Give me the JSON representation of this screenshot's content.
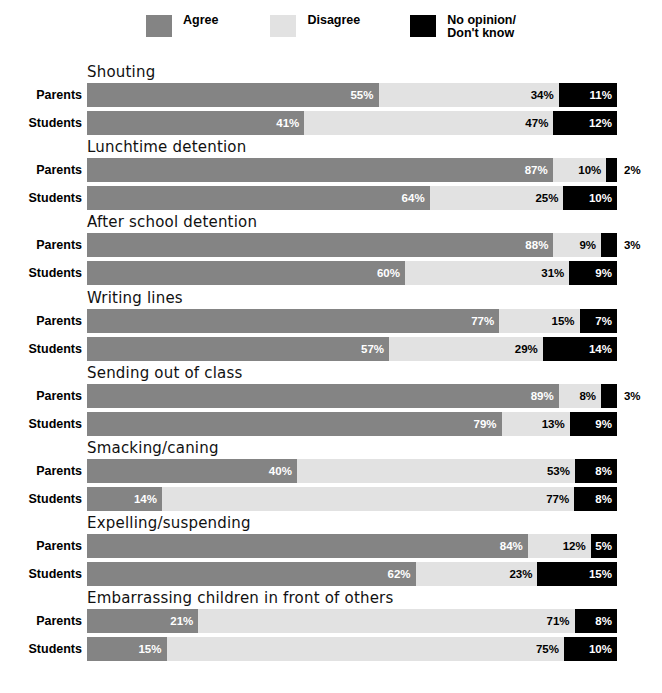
{
  "chart_data": {
    "type": "bar",
    "subtype": "stacked-horizontal-100",
    "title": "",
    "xlabel": "",
    "ylabel": "",
    "xlim": [
      0,
      100
    ],
    "grid": false,
    "legend_position": "top-center",
    "legend": [
      {
        "name": "Agree",
        "color": "#848484"
      },
      {
        "name": "Disagree",
        "color": "#e2e2e2"
      },
      {
        "name": "No opinion/\nDon't know",
        "color": "#000000"
      }
    ],
    "series": [
      {
        "name": "Agree",
        "color": "#848484"
      },
      {
        "name": "Disagree",
        "color": "#e2e2e2"
      },
      {
        "name": "No opinion/Don't know",
        "color": "#000000"
      }
    ],
    "row_groups": [
      "Parents",
      "Students"
    ],
    "categories": [
      "Shouting",
      "Lunchtime detention",
      "After school detention",
      "Writing lines",
      "Sending out of class",
      "Smacking/caning",
      "Expelling/suspending",
      "Embarrassing children in front of others"
    ],
    "groups": [
      {
        "category": "Shouting",
        "rows": [
          {
            "label": "Parents",
            "values": [
              55,
              34,
              11
            ],
            "labels": [
              "55%",
              "34%",
              "11%"
            ],
            "outside": [
              false,
              false,
              false
            ]
          },
          {
            "label": "Students",
            "values": [
              41,
              47,
              12
            ],
            "labels": [
              "41%",
              "47%",
              "12%"
            ],
            "outside": [
              false,
              false,
              false
            ]
          }
        ]
      },
      {
        "category": "Lunchtime detention",
        "rows": [
          {
            "label": "Parents",
            "values": [
              87,
              10,
              2
            ],
            "labels": [
              "87%",
              "10%",
              "2%"
            ],
            "outside": [
              false,
              false,
              true
            ]
          },
          {
            "label": "Students",
            "values": [
              64,
              25,
              10
            ],
            "labels": [
              "64%",
              "25%",
              "10%"
            ],
            "outside": [
              false,
              false,
              false
            ]
          }
        ]
      },
      {
        "category": "After school detention",
        "rows": [
          {
            "label": "Parents",
            "values": [
              88,
              9,
              3
            ],
            "labels": [
              "88%",
              "9%",
              "3%"
            ],
            "outside": [
              false,
              false,
              true
            ]
          },
          {
            "label": "Students",
            "values": [
              60,
              31,
              9
            ],
            "labels": [
              "60%",
              "31%",
              "9%"
            ],
            "outside": [
              false,
              false,
              false
            ]
          }
        ]
      },
      {
        "category": "Writing lines",
        "rows": [
          {
            "label": "Parents",
            "values": [
              77,
              15,
              7
            ],
            "labels": [
              "77%",
              "15%",
              "7%"
            ],
            "outside": [
              false,
              false,
              false
            ]
          },
          {
            "label": "Students",
            "values": [
              57,
              29,
              14
            ],
            "labels": [
              "57%",
              "29%",
              "14%"
            ],
            "outside": [
              false,
              false,
              false
            ]
          }
        ]
      },
      {
        "category": "Sending out of class",
        "rows": [
          {
            "label": "Parents",
            "values": [
              89,
              8,
              3
            ],
            "labels": [
              "89%",
              "8%",
              "3%"
            ],
            "outside": [
              false,
              false,
              true
            ]
          },
          {
            "label": "Students",
            "values": [
              79,
              13,
              9
            ],
            "labels": [
              "79%",
              "13%",
              "9%"
            ],
            "outside": [
              false,
              false,
              false
            ]
          }
        ]
      },
      {
        "category": "Smacking/caning",
        "rows": [
          {
            "label": "Parents",
            "values": [
              40,
              53,
              8
            ],
            "labels": [
              "40%",
              "53%",
              "8%"
            ],
            "outside": [
              false,
              false,
              false
            ]
          },
          {
            "label": "Students",
            "values": [
              14,
              77,
              8
            ],
            "labels": [
              "14%",
              "77%",
              "8%"
            ],
            "outside": [
              false,
              false,
              false
            ]
          }
        ]
      },
      {
        "category": "Expelling/suspending",
        "rows": [
          {
            "label": "Parents",
            "values": [
              84,
              12,
              5
            ],
            "labels": [
              "84%",
              "12%",
              "5%"
            ],
            "outside": [
              false,
              false,
              false
            ]
          },
          {
            "label": "Students",
            "values": [
              62,
              23,
              15
            ],
            "labels": [
              "62%",
              "23%",
              "15%"
            ],
            "outside": [
              false,
              false,
              false
            ]
          }
        ]
      },
      {
        "category": "Embarrassing children in front of others",
        "rows": [
          {
            "label": "Parents",
            "values": [
              21,
              71,
              8
            ],
            "labels": [
              "21%",
              "71%",
              "8%"
            ],
            "outside": [
              false,
              false,
              false
            ]
          },
          {
            "label": "Students",
            "values": [
              15,
              75,
              10
            ],
            "labels": [
              "15%",
              "75%",
              "10%"
            ],
            "outside": [
              false,
              false,
              false
            ]
          }
        ]
      }
    ]
  }
}
